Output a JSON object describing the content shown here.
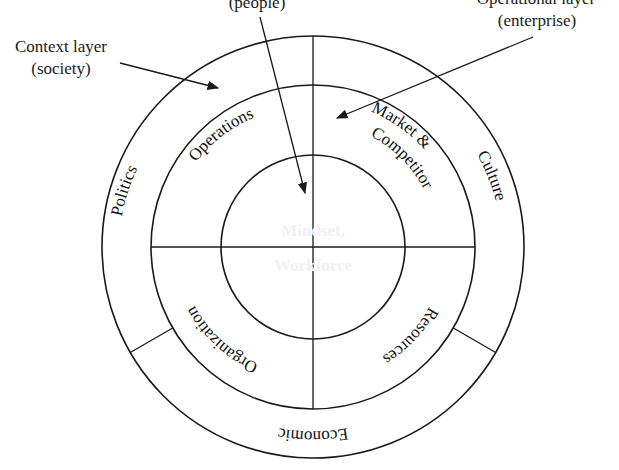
{
  "diagram": {
    "type": "concentric-layers",
    "colors": {
      "background": "#ffffff",
      "outer_ring": "#cdcdcd",
      "middle_ring": "#8e8e8e",
      "core": "#4a4a4a",
      "lines": "#1a1a1a",
      "core_text": "#f2f2f2"
    },
    "callouts": {
      "context": {
        "line1": "Context layer",
        "line2": "(society)"
      },
      "people": {
        "line1": "(people)"
      },
      "operational": {
        "line1": "Operational layer",
        "line2": "(enterprise)"
      }
    },
    "core": {
      "line1": "Mindset,",
      "line2": "Workforce"
    },
    "middle_ring": {
      "segments": [
        {
          "label": "Operations",
          "position": "top-left"
        },
        {
          "label": "Market &",
          "label2": "Competitor",
          "position": "top-right"
        },
        {
          "label": "Resources",
          "position": "bottom-right"
        },
        {
          "label": "Organization",
          "position": "bottom-left"
        }
      ]
    },
    "outer_ring": {
      "segments": [
        {
          "label": "Politics",
          "position": "left"
        },
        {
          "label": "Culture",
          "position": "right"
        },
        {
          "label": "Economic",
          "position": "bottom"
        }
      ]
    }
  }
}
